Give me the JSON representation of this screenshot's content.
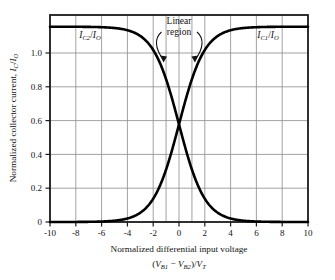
{
  "chart_data": {
    "type": "line",
    "title": "",
    "xlabel": "Normalized differential input voltage (V_B1 - V_B2)/V_T",
    "ylabel": "Normalized collector current, I_C/I_O",
    "xlim": [
      -10,
      10
    ],
    "ylim": [
      0,
      1.06
    ],
    "xticks": [
      -10,
      -8,
      -6,
      -4,
      -2,
      0,
      2,
      4,
      6,
      8,
      10
    ],
    "yticks": [
      0,
      0.2,
      0.4,
      0.6,
      0.8,
      1.0
    ],
    "xtick_labels": [
      "-10",
      "-8",
      "-6",
      "-4",
      "-2",
      "0",
      "2",
      "4",
      "6",
      "8",
      "10"
    ],
    "ytick_labels": [
      "0",
      "0.2",
      "0.4",
      "0.6",
      "0.8",
      "1.0"
    ],
    "grid": true,
    "legend_position": "inline-curve-labels",
    "x": [
      -10,
      -9.5,
      -9,
      -8.5,
      -8,
      -7.5,
      -7,
      -6.5,
      -6,
      -5.5,
      -5,
      -4.5,
      -4,
      -3.5,
      -3,
      -2.5,
      -2,
      -1.5,
      -1,
      -0.5,
      0,
      0.5,
      1,
      1.5,
      2,
      2.5,
      3,
      3.5,
      4,
      4.5,
      5,
      5.5,
      6,
      6.5,
      7,
      7.5,
      8,
      8.5,
      9,
      9.5,
      10
    ],
    "series": [
      {
        "name": "I_C1/I_O",
        "label": "I_C1/I_O",
        "equation": "1/(1+exp(-x))",
        "color": "#000000",
        "values": [
          4.54e-05,
          7.49e-05,
          0.0001234,
          0.0002034,
          0.0003354,
          0.0005527,
          0.000911,
          0.0015012,
          0.0024726,
          0.0040702,
          0.0066929,
          0.0109869,
          0.0179862,
          0.0293122,
          0.0474259,
          0.0758582,
          0.1192029,
          0.1824255,
          0.2689414,
          0.3775407,
          0.5,
          0.6224593,
          0.7310586,
          0.8175745,
          0.8807971,
          0.9241418,
          0.9525741,
          0.9706878,
          0.9820138,
          0.9890131,
          0.9933071,
          0.9959298,
          0.9975274,
          0.9984988,
          0.999089,
          0.9994473,
          0.9996646,
          0.9997966,
          0.9998766,
          0.9999251,
          0.9999546
        ]
      },
      {
        "name": "I_C2/I_O",
        "label": "I_C2/I_O",
        "equation": "1/(1+exp(x))",
        "color": "#000000",
        "values": [
          0.9999546,
          0.9999251,
          0.9998766,
          0.9997966,
          0.9996646,
          0.9994473,
          0.999089,
          0.9984988,
          0.9975274,
          0.9959298,
          0.9933071,
          0.9890131,
          0.9820138,
          0.9706878,
          0.9525741,
          0.9241418,
          0.8807971,
          0.8175745,
          0.7310586,
          0.6224593,
          0.5,
          0.3775407,
          0.2689414,
          0.1824255,
          0.1192029,
          0.0758582,
          0.0474259,
          0.0293122,
          0.0179862,
          0.0109869,
          0.0066929,
          0.0040702,
          0.0024726,
          0.0015012,
          0.000911,
          0.0005527,
          0.0003354,
          0.0002034,
          0.0001234,
          7.49e-05,
          4.54e-05
        ]
      }
    ],
    "annotations": [
      {
        "name": "linear-region",
        "text_line1": "Linear",
        "text_line2": "region",
        "x_span": [
          -1,
          1
        ],
        "marker_color": "#bfbfbf"
      }
    ]
  },
  "labels": {
    "y_axis": {
      "prefix": "Normalized collector current, ",
      "var_main": "I",
      "var_sub": "C",
      "slash": "/",
      "var_main2": "I",
      "var_sub2": "O"
    },
    "x_axis": {
      "line1": "Normalized differential input voltage",
      "line2_open": "(",
      "line2_v1": "V",
      "line2_v1sub": "B1",
      "line2_minus": " − ",
      "line2_v2": "V",
      "line2_v2sub": "B2",
      "line2_close": ")/",
      "line2_vt": "V",
      "line2_vtsub": "T"
    },
    "curve_left": {
      "main": "I",
      "sub": "C2",
      "slash": "/",
      "main2": "I",
      "sub2": "O"
    },
    "curve_right": {
      "main": "I",
      "sub": "C1",
      "slash": "/",
      "main2": "I",
      "sub2": "O"
    },
    "annotation": {
      "line1": "Linear",
      "line2": "region"
    }
  },
  "ticks": {
    "x": [
      "-10",
      "-8",
      "-6",
      "-4",
      "-2",
      "0",
      "2",
      "4",
      "6",
      "8",
      "10"
    ],
    "y": [
      "1.0",
      "0.8",
      "0.6",
      "0.4",
      "0.2",
      "0"
    ]
  },
  "colors": {
    "curve": "#000000",
    "frame": "#1a1a1a",
    "grid": "#8a8a8a",
    "linear_marker": "#c4c4c4",
    "background": "#ffffff"
  }
}
